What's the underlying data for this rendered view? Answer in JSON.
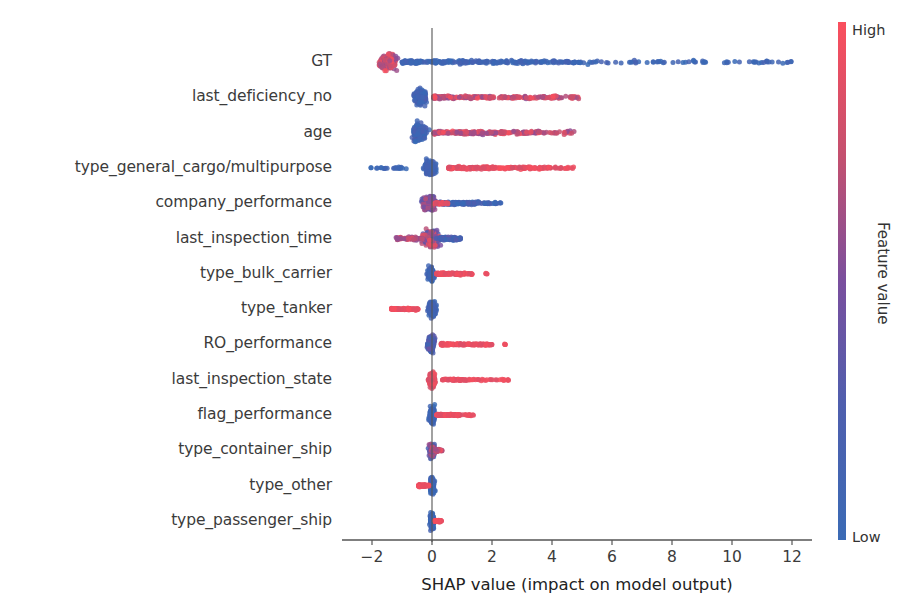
{
  "chart_data": {
    "type": "scatter",
    "subtype": "shap-beeswarm-summary",
    "title": "",
    "xlabel": "SHAP value (impact on model output)",
    "ylabel": "",
    "xlim": [
      -3.0,
      13.0
    ],
    "xticks": [
      -2,
      0,
      2,
      4,
      6,
      8,
      10,
      12
    ],
    "xticklabels": [
      "−2",
      "0",
      "2",
      "4",
      "6",
      "8",
      "10",
      "12"
    ],
    "grid": false,
    "zero_reference_line": 0,
    "colorbar": {
      "label": "Feature value",
      "high_label": "High",
      "low_label": "Low",
      "high_color": "#fa4f5d",
      "low_color": "#3b6bb5",
      "mid_color": "#8b4a9c",
      "position": "right"
    },
    "categories": [
      "GT",
      "last_deficiency_no",
      "age",
      "type_general_cargo/multipurpose",
      "company_performance",
      "last_inspection_time",
      "type_bulk_carrier",
      "type_tanker",
      "RO_performance",
      "last_inspection_state",
      "flag_performance",
      "type_container_ship",
      "type_other",
      "type_passenger_ship"
    ],
    "series": [
      {
        "name": "GT",
        "shap_range": [
          -2.3,
          12.1
        ],
        "core_center": -1.45,
        "description": "Dense red/purple cluster near -1.5; long blue tail extending right to 12",
        "n_points": 640
      },
      {
        "name": "last_deficiency_no",
        "shap_range": [
          -1.1,
          4.9
        ],
        "core_center": -0.35,
        "description": "Blue cluster left of zero; red tail to +4.9",
        "n_points": 460
      },
      {
        "name": "age",
        "shap_range": [
          -1.2,
          4.8
        ],
        "core_center": -0.4,
        "description": "Blue cluster left of zero; red tail to +4.8",
        "n_points": 470
      },
      {
        "name": "type_general_cargo/multipurpose",
        "shap_range": [
          -2.1,
          4.8
        ],
        "core_center": -0.05,
        "description": "Blue points at and left of zero; solid red band from +0.6 to +4.1",
        "n_points": 390
      },
      {
        "name": "company_performance",
        "shap_range": [
          -1.0,
          2.3
        ],
        "core_center": -0.1,
        "description": "Purple core; blue tail to the right up to +2.3",
        "n_points": 400
      },
      {
        "name": "last_inspection_time",
        "shap_range": [
          -1.2,
          0.95
        ],
        "core_center": -0.05,
        "description": "Mixed blue/red compact cluster around zero",
        "n_points": 420
      },
      {
        "name": "type_bulk_carrier",
        "shap_range": [
          -0.35,
          1.85
        ],
        "core_center": -0.05,
        "description": "Blue at zero; red band from +0.15 to +1.3 plus outlier near +1.8",
        "n_points": 300
      },
      {
        "name": "type_tanker",
        "shap_range": [
          -1.35,
          0.35
        ],
        "core_center": 0.0,
        "description": "Blue at zero; red band extending left to -1.35",
        "n_points": 280
      },
      {
        "name": "RO_performance",
        "shap_range": [
          -0.5,
          2.45
        ],
        "core_center": -0.05,
        "description": "Dark blue core; red band from +0.3 to +2.0, outlier +2.45",
        "n_points": 330
      },
      {
        "name": "last_inspection_state",
        "shap_range": [
          -0.5,
          2.6
        ],
        "core_center": 0.0,
        "description": "Red core and red dashes extending right to +2.6",
        "n_points": 300
      },
      {
        "name": "flag_performance",
        "shap_range": [
          -0.45,
          1.5
        ],
        "core_center": 0.0,
        "description": "Blue core at zero; red band to +1.5",
        "n_points": 320
      },
      {
        "name": "type_container_ship",
        "shap_range": [
          -0.3,
          0.35
        ],
        "core_center": 0.0,
        "description": "Tiny mixed cluster tight around zero",
        "n_points": 240
      },
      {
        "name": "type_other",
        "shap_range": [
          -0.45,
          0.2
        ],
        "core_center": 0.0,
        "description": "Blue core at zero; red band extending left to -0.45",
        "n_points": 240
      },
      {
        "name": "type_passenger_ship",
        "shap_range": [
          -0.15,
          0.35
        ],
        "core_center": 0.0,
        "description": "Blue core at zero; short red band to +0.35",
        "n_points": 220
      }
    ]
  },
  "axis": {
    "xlabel": "SHAP value (impact on model output)",
    "xticklabels": [
      "−2",
      "0",
      "2",
      "4",
      "6",
      "8",
      "10",
      "12"
    ]
  },
  "colorbar": {
    "high_label": "High",
    "low_label": "Low",
    "title": "Feature value"
  },
  "features": [
    "GT",
    "last_deficiency_no",
    "age",
    "type_general_cargo/multipurpose",
    "company_performance",
    "last_inspection_time",
    "type_bulk_carrier",
    "type_tanker",
    "RO_performance",
    "last_inspection_state",
    "flag_performance",
    "type_container_ship",
    "type_other",
    "type_passenger_ship"
  ]
}
